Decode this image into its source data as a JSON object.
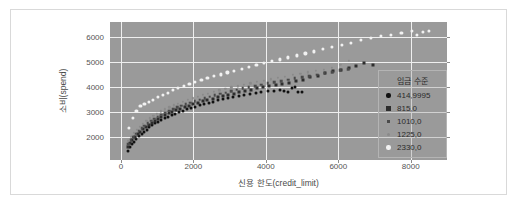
{
  "figure": {
    "background": "#ffffff",
    "frame_color": "#d9d9d9",
    "plot_background": "#9a9a9a",
    "grid_color": "#efefef"
  },
  "chart_data": {
    "type": "scatter",
    "title": "",
    "xlabel": "신용 한도(credit_limit)",
    "ylabel": "소비(spend)",
    "xlim": [
      -300,
      9000
    ],
    "ylim": [
      1100,
      6600
    ],
    "xticks": [
      0,
      2000,
      4000,
      6000,
      8000
    ],
    "yticks": [
      2000,
      3000,
      4000,
      5000,
      6000
    ],
    "xticklabels": [
      "0",
      "2000",
      "4000",
      "6000",
      "8000"
    ],
    "yticklabels": [
      "2000",
      "3000",
      "4000",
      "5000",
      "6000"
    ],
    "grid": true,
    "legend_position": "right-inside",
    "legend_title": "임금 수준",
    "series": [
      {
        "name": "414.9995",
        "color": "#111111",
        "marker": "circle",
        "marker_size": 3.0,
        "x": [
          190,
          250,
          310,
          370,
          430,
          500,
          570,
          640,
          710,
          790,
          870,
          950,
          1030,
          1120,
          1210,
          1300,
          1400,
          1500,
          1600,
          1710,
          1820,
          1930,
          2050,
          2170,
          2290,
          2420,
          2550,
          2680,
          2820,
          2960,
          3100,
          3250,
          3400,
          3560,
          3720,
          3880,
          4050,
          4220,
          4380,
          4500,
          4620,
          4720,
          4800,
          4900,
          5000
        ],
        "y": [
          1470,
          1600,
          1720,
          1830,
          1930,
          2040,
          2140,
          2230,
          2310,
          2400,
          2480,
          2560,
          2630,
          2700,
          2770,
          2830,
          2890,
          2950,
          3010,
          3070,
          3120,
          3180,
          3230,
          3280,
          3330,
          3380,
          3430,
          3480,
          3520,
          3570,
          3610,
          3650,
          3690,
          3730,
          3770,
          3800,
          3840,
          3860,
          3880,
          3840,
          3800,
          3950,
          4000,
          3800,
          3820
        ]
      },
      {
        "name": "815.0",
        "color": "#2d2d2d",
        "marker": "square",
        "marker_size": 3.0,
        "x": [
          200,
          260,
          320,
          390,
          460,
          530,
          610,
          690,
          770,
          850,
          940,
          1030,
          1120,
          1220,
          1320,
          1420,
          1530,
          1640,
          1760,
          1880,
          2000,
          2130,
          2260,
          2390,
          2530,
          2670,
          2810,
          2960,
          3110,
          3270,
          3430,
          3590,
          3760,
          3930,
          4100,
          4280,
          4460,
          4650,
          4840,
          5030,
          5230,
          5430,
          5640,
          5850,
          6070,
          6290,
          6500,
          6720,
          6950
        ],
        "y": [
          1620,
          1760,
          1890,
          2010,
          2120,
          2230,
          2330,
          2420,
          2510,
          2590,
          2670,
          2750,
          2820,
          2890,
          2960,
          3030,
          3090,
          3150,
          3210,
          3270,
          3330,
          3380,
          3440,
          3490,
          3550,
          3600,
          3650,
          3700,
          3750,
          3800,
          3850,
          3900,
          3950,
          4000,
          4050,
          4090,
          4140,
          4180,
          4230,
          4270,
          4400,
          4460,
          4550,
          4630,
          4700,
          4780,
          4830,
          4950,
          4900
        ]
      },
      {
        "name": "1010.0",
        "color": "#4a4a4a",
        "marker": "square",
        "marker_size": 2.6,
        "x": [
          200,
          270,
          340,
          410,
          490,
          570,
          650,
          740,
          830,
          920,
          1020,
          1120,
          1220,
          1330,
          1440,
          1550,
          1670,
          1790,
          1910,
          2040,
          2170,
          2310,
          2450,
          2590,
          2740,
          2890,
          3040,
          3200,
          3360,
          3530,
          3700,
          3870,
          4050,
          4230,
          4420,
          4610,
          4800,
          5000,
          5200,
          5410,
          5620,
          5830,
          6050,
          6270
        ],
        "y": [
          1720,
          1880,
          2010,
          2140,
          2260,
          2370,
          2470,
          2570,
          2660,
          2750,
          2830,
          2910,
          2990,
          3060,
          3130,
          3200,
          3270,
          3330,
          3390,
          3450,
          3510,
          3570,
          3630,
          3680,
          3740,
          3790,
          3840,
          3900,
          3950,
          4000,
          4050,
          4100,
          4150,
          4200,
          4250,
          4300,
          4350,
          4400,
          4450,
          4500,
          4560,
          4610,
          4670,
          4720
        ]
      },
      {
        "name": "1225.0",
        "color": "#8a8a8a",
        "marker": "circle",
        "marker_size": 2.3,
        "x": [
          210,
          280,
          360,
          440,
          520,
          610,
          700,
          800,
          900,
          1000,
          1110,
          1220,
          1340,
          1460,
          1580,
          1710,
          1840,
          1980,
          2120,
          2260,
          2410,
          2560,
          2720,
          2880,
          3050,
          3220,
          3390,
          3570,
          3750,
          3940,
          4130,
          4330,
          4530,
          4740,
          4950,
          5160,
          5380,
          5600,
          5830,
          6060,
          6290
        ],
        "y": [
          1850,
          2020,
          2170,
          2310,
          2430,
          2550,
          2660,
          2760,
          2860,
          2950,
          3040,
          3120,
          3200,
          3280,
          3350,
          3420,
          3490,
          3560,
          3620,
          3690,
          3750,
          3810,
          3870,
          3930,
          3990,
          4040,
          4100,
          4150,
          4210,
          4260,
          4320,
          4370,
          4420,
          4480,
          4530,
          4590,
          4640,
          4700,
          4760,
          4880,
          5060
        ]
      },
      {
        "name": "2330.0",
        "color": "#f2f2f2",
        "marker": "circle",
        "marker_size": 3.2,
        "x": [
          230,
          330,
          430,
          540,
          650,
          770,
          890,
          1020,
          1150,
          1290,
          1430,
          1580,
          1730,
          1890,
          2050,
          2220,
          2390,
          2570,
          2750,
          2940,
          3130,
          3330,
          3530,
          3740,
          3950,
          4170,
          4390,
          4620,
          4850,
          5090,
          5330,
          5580,
          5830,
          6090,
          6350,
          6620,
          6890,
          7170,
          7450,
          7740,
          8030,
          8180,
          8330,
          8500
        ],
        "y": [
          2370,
          2780,
          3050,
          3260,
          3350,
          3430,
          3510,
          3610,
          3700,
          3790,
          3880,
          3970,
          4050,
          4130,
          4210,
          4290,
          4360,
          4440,
          4510,
          4590,
          4660,
          4740,
          4810,
          4890,
          4960,
          5040,
          5110,
          5190,
          5270,
          5350,
          5430,
          5520,
          5600,
          5690,
          5780,
          5880,
          5960,
          6030,
          6090,
          6170,
          6230,
          6090,
          6200,
          6230
        ]
      }
    ]
  }
}
